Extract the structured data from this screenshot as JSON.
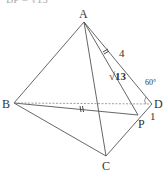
{
  "header": {
    "partial_text": "BP = √13"
  },
  "diagram": {
    "type": "tetrahedron",
    "vertices": {
      "A": {
        "label": "A",
        "x": 84,
        "y": 22
      },
      "B": {
        "label": "B",
        "x": 14,
        "y": 103
      },
      "C": {
        "label": "C",
        "x": 106,
        "y": 156
      },
      "D": {
        "label": "D",
        "x": 152,
        "y": 104
      },
      "P": {
        "label": "P",
        "x": 138,
        "y": 115
      }
    },
    "annotations": {
      "ad_length": "4",
      "ap_length": "√13",
      "angle": "60°",
      "dp_length": "1"
    },
    "colors": {
      "line": "#555555",
      "text": "#333333",
      "dashed": "#888888"
    }
  }
}
